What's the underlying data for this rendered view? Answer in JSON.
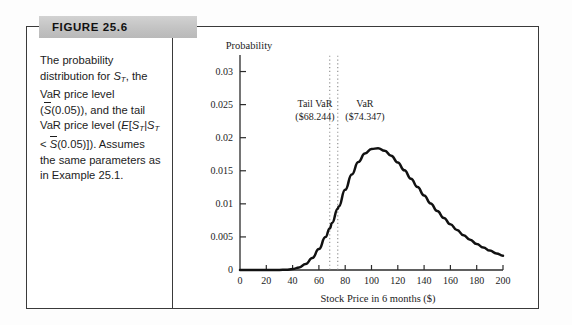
{
  "figure": {
    "banner_label": "FIGURE 25.6",
    "caption_lines": [
      "The probability",
      "distribution for S_T, the",
      "VaR price level",
      "(S̄(0.05)), and the tail",
      "VaR price level (E[S_T|S_T",
      "< S̄(0.05)]). Assumes",
      "the same parameters as",
      "in Example 25.1."
    ]
  },
  "chart_data": {
    "type": "line",
    "title": "",
    "xlabel": "Stock Price in 6 months ($)",
    "ylabel": "Probability",
    "xlim": [
      0,
      200
    ],
    "ylim": [
      0,
      0.0325
    ],
    "xticks": [
      0,
      20,
      40,
      60,
      80,
      100,
      120,
      140,
      160,
      180,
      200
    ],
    "xtick_labels": [
      "0",
      "20",
      "40",
      "60",
      "80",
      "100",
      "120",
      "140",
      "160",
      "180",
      "200"
    ],
    "yticks": [
      0,
      0.005,
      0.01,
      0.015,
      0.02,
      0.025,
      0.03
    ],
    "ytick_labels": [
      "0",
      "0.005",
      "0.01",
      "0.015",
      "0.02",
      "0.025",
      "0.03"
    ],
    "grid": false,
    "legend": "none",
    "series": [
      {
        "name": "Lognormal density of S_T",
        "x": [
          0,
          5,
          10,
          15,
          20,
          25,
          30,
          35,
          40,
          45,
          50,
          55,
          60,
          65,
          68.244,
          70,
          74.347,
          75,
          80,
          85,
          90,
          95,
          100,
          105,
          110,
          115,
          120,
          125,
          130,
          135,
          140,
          145,
          150,
          155,
          160,
          165,
          170,
          175,
          180,
          185,
          190,
          195,
          200
        ],
        "y": [
          0,
          0,
          0,
          0,
          0,
          0,
          1e-05,
          4e-05,
          0.00014,
          0.00039,
          0.00091,
          0.00181,
          0.00316,
          0.00497,
          0.00628,
          0.00711,
          0.00926,
          0.00958,
          0.01212,
          0.01444,
          0.01632,
          0.01762,
          0.0183,
          0.0184,
          0.01802,
          0.01727,
          0.01625,
          0.01507,
          0.01381,
          0.01253,
          0.01127,
          0.01006,
          0.00892,
          0.00787,
          0.00691,
          0.00604,
          0.00526,
          0.00456,
          0.00394,
          0.0034,
          0.00293,
          0.00251,
          0.00215
        ]
      }
    ],
    "annotations": [
      {
        "name": "tail-var",
        "label_line1": "Tail VaR",
        "label_line2": "($68.244)",
        "x_value": 68.244,
        "label_x": 57,
        "marker": "dotted-vertical-line"
      },
      {
        "name": "var",
        "label_line1": "VaR",
        "label_line2": "($74.347)",
        "x_value": 74.347,
        "label_x": 95,
        "marker": "dotted-vertical-line"
      }
    ],
    "vline_top_value": 0.0324
  }
}
